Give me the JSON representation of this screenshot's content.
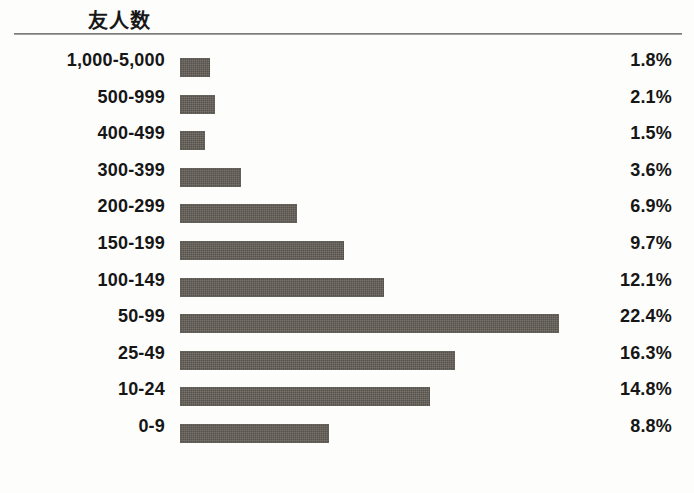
{
  "chart_data": {
    "type": "bar",
    "orientation": "horizontal",
    "title": "友人数",
    "xlabel": "",
    "ylabel": "",
    "value_suffix": "%",
    "xlim": [
      0,
      25
    ],
    "grid": false,
    "legend": null,
    "categories": [
      "1,000-5,000",
      "500-999",
      "400-499",
      "300-399",
      "200-299",
      "150-199",
      "100-149",
      "50-99",
      "25-49",
      "10-24",
      "0-9"
    ],
    "values": [
      1.8,
      2.1,
      1.5,
      3.6,
      6.9,
      9.7,
      12.1,
      22.4,
      16.3,
      14.8,
      8.8
    ],
    "value_labels": [
      "1.8%",
      "2.1%",
      "1.5%",
      "3.6%",
      "6.9%",
      "9.7%",
      "12.1%",
      "22.4%",
      "16.3%",
      "14.8%",
      "8.8%"
    ],
    "bar_color": "#57524b",
    "background_color": "#fdfdfc",
    "rule_color": "#6f6f6f",
    "text_color": "#161616"
  }
}
